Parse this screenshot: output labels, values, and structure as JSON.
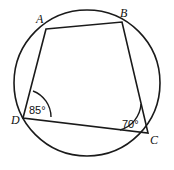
{
  "figure": {
    "kind": "cyclic-quadrilateral-in-circle",
    "background_color": "#ffffff",
    "stroke_color": "#1a1a1a",
    "circle": {
      "center_x": 87,
      "center_y": 83,
      "radius": 73,
      "stroke_width": 1.6
    },
    "quadrilateral": {
      "stroke_width": 1.6,
      "fill": "none",
      "path": "M 46 29 L 122 22 L 148 133 L 23 118 Z"
    },
    "vertices": [
      {
        "name": "A",
        "label": "A",
        "point_x": 46,
        "point_y": 29,
        "label_x": 36,
        "label_y": 23
      },
      {
        "name": "B",
        "label": "B",
        "point_x": 122,
        "point_y": 22,
        "label_x": 120,
        "label_y": 17
      },
      {
        "name": "C",
        "label": "C",
        "point_x": 148,
        "point_y": 133,
        "label_x": 150,
        "label_y": 144
      },
      {
        "name": "D",
        "label": "D",
        "point_x": 23,
        "point_y": 118,
        "label_x": 11,
        "label_y": 124
      }
    ],
    "angles": [
      {
        "at_vertex": "D",
        "value": "85°",
        "arc_path": "M 51 117 A 28 28 0 0 0 33 91",
        "label_x": 29,
        "label_y": 114,
        "stroke_width": 1.4
      },
      {
        "at_vertex": "C",
        "value": "70°",
        "arc_path": "M 120 130 A 29 29 0 0 0 141 104",
        "label_x": 122,
        "label_y": 128,
        "stroke_width": 1.4
      }
    ]
  }
}
